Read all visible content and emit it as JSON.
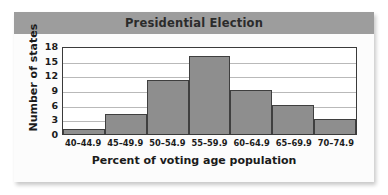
{
  "chart_data": {
    "type": "bar",
    "title": "Presidential Election",
    "xlabel": "Percent of voting age population",
    "ylabel": "Number of states",
    "categories": [
      "40–44.9",
      "45–49.9",
      "50–54.9",
      "55–59.9",
      "60–64.9",
      "65–69.9",
      "70–74.9"
    ],
    "values": [
      1,
      4,
      11,
      16,
      9,
      6,
      3
    ],
    "ylim": [
      0,
      18
    ],
    "yticks": [
      0,
      3,
      6,
      9,
      12,
      15,
      18
    ],
    "ytick_labels": [
      "0",
      "3",
      "6",
      "9",
      "12",
      "15",
      "18"
    ],
    "grid": "horizontal",
    "legend": "none",
    "colors": {
      "bar_fill": "#8e8e8e",
      "bar_edge": "#3f3f3f",
      "title_band": "#9d9d9d",
      "plot_background": "#ffffff",
      "gridline": "#b9b9b9",
      "axis_frame": "#3a3a3a",
      "text": "#1b1b1b"
    }
  }
}
